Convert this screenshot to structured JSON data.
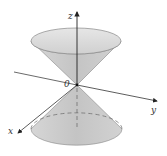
{
  "figure": {
    "type": "double-cone",
    "labels": {
      "z_axis": "z",
      "y_axis": "y",
      "x_axis": "x",
      "origin": "0"
    },
    "colors": {
      "cone_fill": "#cfcfcf",
      "cone_rim_fill": "#e2e2e2",
      "axis": "#333333",
      "outline": "#777777"
    }
  }
}
